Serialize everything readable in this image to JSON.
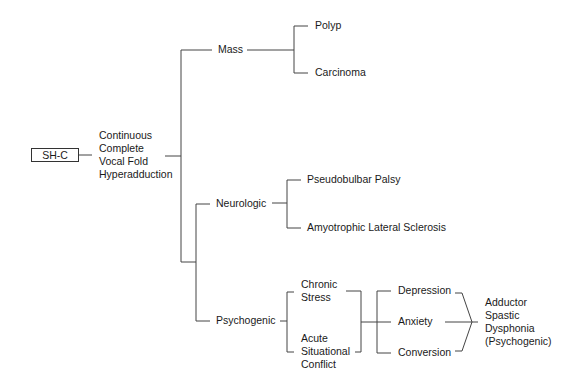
{
  "diagram": {
    "type": "decision-tree",
    "root": {
      "label": "SH-C",
      "description": "Continuous\nComplete\nVocal Fold\nHyperadduction"
    },
    "branches": {
      "mass": {
        "label": "Mass",
        "children": [
          "Polyp",
          "Carcinoma"
        ]
      },
      "neurologic": {
        "label": "Neurologic",
        "children": [
          "Pseudobulbar Palsy",
          "Amyotrophic Lateral Sclerosis"
        ]
      },
      "psychogenic": {
        "label": "Psychogenic",
        "causes": [
          "Chronic\nStress",
          "Acute\nSituational\nConflict"
        ],
        "conditions": [
          "Depression",
          "Anxiety",
          "Conversion"
        ],
        "outcome": "Adductor\nSpastic\nDysphonia\n(Psychogenic)"
      }
    },
    "colors": {
      "line": "#444444",
      "text": "#1a1a1a",
      "background": "#ffffff"
    }
  }
}
